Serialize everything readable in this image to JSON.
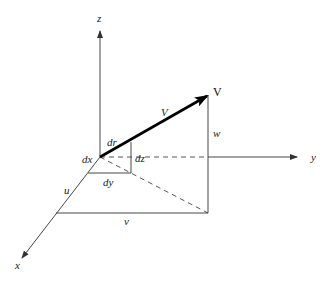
{
  "diagram": {
    "axes": {
      "x": "x",
      "y": "y",
      "z": "z"
    },
    "vector": {
      "label_tip": "V",
      "label_mid": "V"
    },
    "components": {
      "u": "u",
      "v": "v",
      "w": "w"
    },
    "differentials": {
      "dr": "dr",
      "dx": "dx",
      "dy": "dy",
      "dz": "dz"
    },
    "colors": {
      "ink": "#333333",
      "vector": "#000000"
    }
  }
}
